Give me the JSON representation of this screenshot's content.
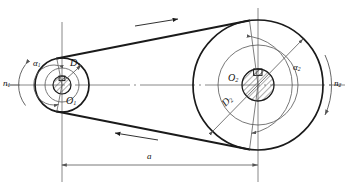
{
  "diagram": {
    "labels": {
      "n1": "n",
      "n1_sub": "1",
      "n2": "n",
      "n2_sub": "2",
      "o1": "O",
      "o1_sub": "1",
      "o2": "O",
      "o2_sub": "2",
      "d1": "D",
      "d1_sub": "1",
      "d2": "D",
      "d2_sub": "2",
      "alpha1": "α",
      "alpha1_sub": "1",
      "alpha2": "α",
      "alpha2_sub": "2",
      "center_distance": "a"
    },
    "colors": {
      "line": "#1a1a1a",
      "thin_line": "#555555",
      "center_line": "#6b6b6b",
      "background": "#ffffff",
      "hatch": "#333333"
    },
    "geometry": {
      "driver_pulley": {
        "name": "small-pulley",
        "cx": 62,
        "cy": 85,
        "outer_r": 27,
        "inner_r": 17,
        "hub_r": 9
      },
      "driven_pulley": {
        "name": "large-pulley",
        "cx": 258,
        "cy": 85,
        "outer_r": 65,
        "inner_r": 40,
        "hub_r": 16
      },
      "center_distance_px": 196
    },
    "belt": {
      "top_arrow_direction": "right",
      "bottom_arrow_direction": "left"
    }
  }
}
